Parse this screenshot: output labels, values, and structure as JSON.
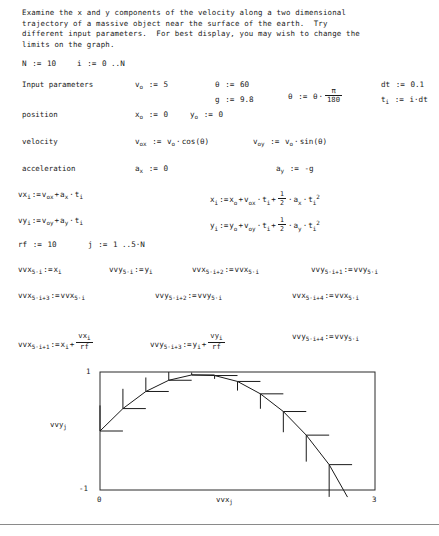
{
  "document": {
    "intro": "Examine the x and y components of the velocity along a two dimensional\ntrajectory of a massive object near the surface of the earth.  Try\ndifferent input parameters.  For best display, you may wish to change the\nlimits on the graph.",
    "labels": {
      "input_parameters": "Input parameters",
      "position": "position",
      "velocity": "velocity",
      "acceleration": "acceleration"
    }
  },
  "definitions": {
    "N": {
      "name": "N",
      "op": ":=",
      "value": "10"
    },
    "i": {
      "name": "i",
      "op": ":=",
      "value": "0 ..N"
    },
    "v0": {
      "name": "v",
      "sub": "o",
      "op": ":=",
      "value": "5"
    },
    "theta_deg": {
      "name": "θ",
      "op": ":=",
      "value": "60"
    },
    "g": {
      "name": "g",
      "op": ":=",
      "value": "9.8"
    },
    "theta_rad": {
      "name": "θ",
      "op": ":=",
      "lhs": "θ",
      "num": "π",
      "den": "180"
    },
    "dt": {
      "name": "dt",
      "op": ":=",
      "value": "0.1"
    },
    "t_i": {
      "name": "t",
      "sub": "i",
      "op": ":=",
      "value": "i·dt"
    },
    "x0": {
      "name": "x",
      "sub": "o",
      "op": ":=",
      "value": "0"
    },
    "y0": {
      "name": "y",
      "sub": "o",
      "op": ":=",
      "value": "0"
    },
    "v0x": {
      "name": "v",
      "sub": "ox",
      "op": ":=",
      "base": "v",
      "base_sub": "o",
      "value": "cos(θ)"
    },
    "v0y": {
      "name": "v",
      "sub": "oy",
      "op": ":=",
      "base": "v",
      "base_sub": "o",
      "value": "sin(θ)"
    },
    "ax": {
      "name": "a",
      "sub": "x",
      "op": ":=",
      "value": "0"
    },
    "ay": {
      "name": "a",
      "sub": "y",
      "op": ":=",
      "value": "-g"
    },
    "rf": {
      "name": "rf",
      "op": ":=",
      "value": "10"
    },
    "j": {
      "name": "j",
      "op": ":=",
      "value": "1 ..5·N"
    }
  },
  "equations": {
    "vx": "vx_i := v_ox + a_x · t_i",
    "vy": "vy_i := v_oy + a_y · t_i",
    "x": "x_i := x_o + v_ox · t_i + 1/2 · a_x · t_i^2",
    "y": "y_i := y_o + v_oy · t_i + 1/2 · a_y · t_i^2",
    "vvx_5i": "vvx_5·i := x_i",
    "vvy_5i": "vvy_5·i := y_i",
    "vvx_5i2": "vvx_5·i+2 := vvx_5·i",
    "vvy_5i1": "vvy_5·i+1 := vvy_5·i",
    "vvx_5i3": "vvx_5·i+3 := vvx_5·i",
    "vvy_5i2": "vvy_5·i+2 := vvy_5·i",
    "vvx_5i4": "vvx_5·i+4 := vvx_5·i",
    "vvx_5i1": "vvx_5·i+1 := x_i + vx_i/rf",
    "vvy_5i3": "vvy_5·i+3 := y_i + vy_i/rf",
    "vvy_5i4": "vvy_5·i+4 := vvy_5·i"
  },
  "chart_data": {
    "type": "line",
    "title": "",
    "xlabel": "vvx",
    "xlabel_sub": "j",
    "ylabel": "vvy",
    "ylabel_sub": "j",
    "xlim": [
      0,
      3
    ],
    "ylim": [
      -1,
      1
    ],
    "xticks": [
      "0",
      "3"
    ],
    "yticks": [
      "1",
      "-1"
    ],
    "grid": false,
    "legend": false,
    "series_name": "trajectory with velocity vectors",
    "trajectory": [
      {
        "t": 0.0,
        "x": 0.0,
        "y": 0.0,
        "vx": 2.5,
        "vy": 4.33
      },
      {
        "t": 0.1,
        "x": 0.25,
        "y": 0.38,
        "vx": 2.5,
        "vy": 3.35
      },
      {
        "t": 0.2,
        "x": 0.5,
        "y": 0.67,
        "vx": 2.5,
        "vy": 2.37
      },
      {
        "t": 0.3,
        "x": 0.75,
        "y": 0.86,
        "vx": 2.5,
        "vy": 1.39
      },
      {
        "t": 0.4,
        "x": 1.0,
        "y": 0.95,
        "vx": 2.5,
        "vy": 0.41
      },
      {
        "t": 0.5,
        "x": 1.25,
        "y": 0.94,
        "vx": 2.5,
        "vy": -0.57
      },
      {
        "t": 0.6,
        "x": 1.5,
        "y": 0.84,
        "vx": 2.5,
        "vy": -1.55
      },
      {
        "t": 0.7,
        "x": 1.75,
        "y": 0.63,
        "vx": 2.5,
        "vy": -2.53
      },
      {
        "t": 0.8,
        "x": 2.0,
        "y": 0.33,
        "vx": 2.5,
        "vy": -3.51
      },
      {
        "t": 0.9,
        "x": 2.25,
        "y": -0.07,
        "vx": 2.5,
        "vy": -4.49
      },
      {
        "t": 1.0,
        "x": 2.5,
        "y": -0.57,
        "vx": 2.5,
        "vy": -5.47
      }
    ]
  }
}
